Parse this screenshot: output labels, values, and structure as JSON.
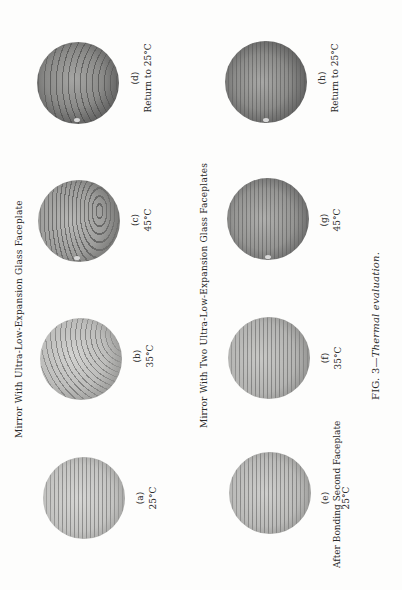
{
  "figure": {
    "orientation": "rotated-90-ccw",
    "caption_prefix": "FIG. 3—",
    "caption_title": "Thermal evaluation.",
    "groups": [
      {
        "title": "Mirror With Ultra-Low-Expansion Glass Faceplate",
        "panels": [
          {
            "id": "(a)",
            "condition": "",
            "temperature": "25°C",
            "fringe_pattern": "straight"
          },
          {
            "id": "(b)",
            "condition": "",
            "temperature": "35°C",
            "fringe_pattern": "curved"
          },
          {
            "id": "(c)",
            "condition": "",
            "temperature": "45°C",
            "fringe_pattern": "loop"
          },
          {
            "id": "(d)",
            "condition": "Return to 25°C",
            "temperature": "",
            "fringe_pattern": "arc"
          }
        ]
      },
      {
        "title": "Mirror With Two Ultra-Low-Expansion Glass Faceplates",
        "panels": [
          {
            "id": "(e)",
            "condition": "After Bonding Second Faceplate",
            "temperature": "25°C",
            "fringe_pattern": "straight"
          },
          {
            "id": "(f)",
            "condition": "",
            "temperature": "35°C",
            "fringe_pattern": "straight"
          },
          {
            "id": "(g)",
            "condition": "",
            "temperature": "45°C",
            "fringe_pattern": "straight"
          },
          {
            "id": "(h)",
            "condition": "Return to 25°C",
            "temperature": "",
            "fringe_pattern": "straight"
          }
        ]
      }
    ]
  }
}
